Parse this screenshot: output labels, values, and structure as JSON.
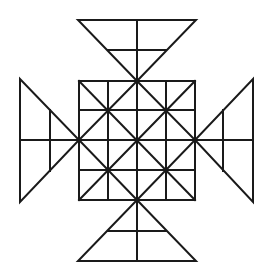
{
  "figure": {
    "stroke_color": "#1a1a1a",
    "background": "#ffffff",
    "square": {
      "x0": 79,
      "y0": 81,
      "x1": 195,
      "y1": 200,
      "grid": 4
    },
    "triangles": [
      "top",
      "bottom",
      "left",
      "right"
    ]
  }
}
